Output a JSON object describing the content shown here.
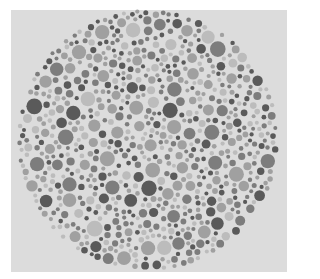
{
  "image": {
    "kind": "ishihara-style-dot-plate",
    "rendering": "grayscale",
    "background_color": "#ffffff",
    "plate_color": "#dcdcdc"
  },
  "plate": {
    "center": [
      148,
      140
    ],
    "radius": 131,
    "dot_radius_range": [
      2,
      8
    ],
    "dot_tones": [
      "#5a5a5a",
      "#7d7d7d",
      "#a0a0a0",
      "#bcbcbc"
    ],
    "tone_weights": [
      0.22,
      0.26,
      0.3,
      0.22
    ],
    "seed": 7
  }
}
